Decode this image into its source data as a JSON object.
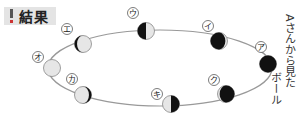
{
  "title": {
    "label": "結果",
    "icon": "exclamation-icon"
  },
  "diagram": {
    "orbit": {
      "cx": 160,
      "cy": 68,
      "rx": 112,
      "ry": 38,
      "stroke": "#999999"
    },
    "moons": [
      {
        "id": "ア",
        "label": "ア",
        "cx": 268,
        "cy": 64,
        "label_x": 261,
        "label_y": 47,
        "phase": "new-full-dark"
      },
      {
        "id": "イ",
        "label": "イ",
        "cx": 219,
        "cy": 41,
        "label_x": 208,
        "label_y": 26,
        "phase": "waning-crescent-light-right"
      },
      {
        "id": "ウ",
        "label": "ウ",
        "cx": 146,
        "cy": 31,
        "label_x": 133,
        "label_y": 13,
        "phase": "left-half-dark"
      },
      {
        "id": "エ",
        "label": "エ",
        "cx": 83,
        "cy": 44,
        "label_x": 67,
        "label_y": 29,
        "phase": "thin-dark-left"
      },
      {
        "id": "オ",
        "label": "オ",
        "cx": 52,
        "cy": 68,
        "label_x": 38,
        "label_y": 57,
        "phase": "all-light"
      },
      {
        "id": "カ",
        "label": "カ",
        "cx": 83,
        "cy": 95,
        "label_x": 72,
        "label_y": 79,
        "phase": "thin-dark-right"
      },
      {
        "id": "キ",
        "label": "キ",
        "cx": 171,
        "cy": 104,
        "label_x": 157,
        "label_y": 94,
        "phase": "right-half-dark"
      },
      {
        "id": "ク",
        "label": "ク",
        "cx": 226,
        "cy": 94,
        "label_x": 214,
        "label_y": 80,
        "phase": "mostly-dark-light-left"
      }
    ],
    "colors": {
      "dark": "#111111",
      "light": "#e6e6e6",
      "outline": "#888888"
    }
  },
  "side_text": {
    "col1": "ボール",
    "col2": "Aさんから見た"
  }
}
